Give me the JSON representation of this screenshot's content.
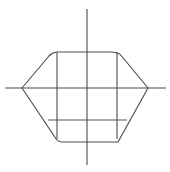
{
  "figure": {
    "background_color": "#ffffff",
    "width": 170,
    "height": 172,
    "line_color": "#4d4d4d",
    "axis_color": "#4a4a4a"
  },
  "chart_data": {
    "type": "line",
    "subtitle": "",
    "xlabel": "",
    "ylabel": "",
    "xlim": [
      0,
      170
    ],
    "ylim": [
      0,
      172
    ],
    "grid": false,
    "legend": null,
    "annotations": [],
    "tick_labels": {
      "x": [],
      "y": []
    },
    "origin": {
      "x": 87,
      "y": 88
    },
    "series": [
      {
        "name": "vertical-axis",
        "kind": "axis",
        "points": [
          [
            87,
            9
          ],
          [
            87,
            165
          ]
        ]
      },
      {
        "name": "horizontal-axis",
        "kind": "axis",
        "points": [
          [
            5,
            88
          ],
          [
            166,
            88
          ]
        ]
      },
      {
        "name": "outer-hull",
        "kind": "closed-polygon",
        "points": [
          [
            57,
            52
          ],
          [
            112,
            52
          ],
          [
            120,
            54
          ],
          [
            148,
            88
          ],
          [
            118,
            142
          ],
          [
            62,
            142
          ],
          [
            57,
            139
          ],
          [
            22,
            88
          ],
          [
            50,
            55
          ]
        ]
      },
      {
        "name": "inner-left-vertical",
        "kind": "segment",
        "points": [
          [
            57,
            52
          ],
          [
            57,
            139
          ]
        ]
      },
      {
        "name": "inner-right-vertical",
        "kind": "segment",
        "points": [
          [
            117,
            52
          ],
          [
            117,
            139
          ]
        ]
      },
      {
        "name": "inner-lower-horizontal",
        "kind": "segment",
        "points": [
          [
            48,
            120
          ],
          [
            127,
            120
          ]
        ]
      }
    ]
  }
}
